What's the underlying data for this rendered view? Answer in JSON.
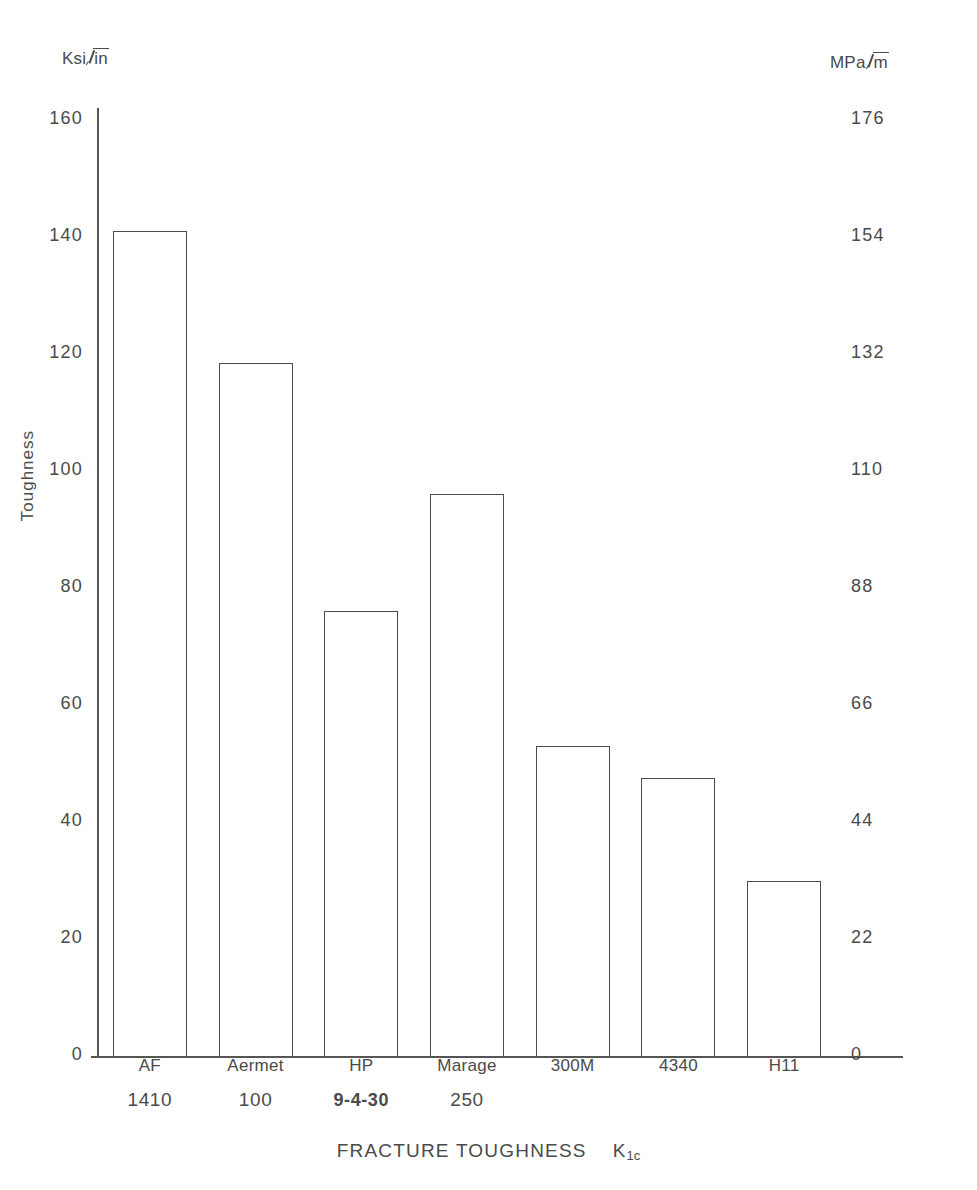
{
  "axes": {
    "left_unit_prefix": "Ksi",
    "left_unit_radicand": "in",
    "right_unit_prefix": "MPa",
    "right_unit_radicand": "m",
    "y_title": "Toughness",
    "x_title_main": "FRACTURE TOUGHNESS",
    "x_title_symbol": "K",
    "x_title_symbol_sub": "1c"
  },
  "chart_data": {
    "type": "bar",
    "xlabel": "FRACTURE TOUGHNESS  K1c",
    "ylabel": "Toughness",
    "y_unit_left": "Ksi√in",
    "y_unit_right": "MPa√m",
    "ylim": [
      0,
      160
    ],
    "ylim_right": [
      0,
      176
    ],
    "grid": false,
    "legend": "none",
    "categories": [
      "AF 1410",
      "Aermet 100",
      "HP 9-4-30",
      "Marage 250",
      "300M",
      "4340",
      "H11"
    ],
    "category_lines": [
      {
        "line1": "AF",
        "line2": "1410",
        "bold": false
      },
      {
        "line1": "Aermet",
        "line2": "100",
        "bold": false
      },
      {
        "line1": "HP",
        "line2": "9-4-30",
        "bold": true
      },
      {
        "line1": "Marage",
        "line2": "250",
        "bold": false
      },
      {
        "line1": "300M",
        "line2": "",
        "bold": false
      },
      {
        "line1": "4340",
        "line2": "",
        "bold": false
      },
      {
        "line1": "H11",
        "line2": "",
        "bold": false
      }
    ],
    "values": [
      141,
      118.5,
      76,
      96,
      53,
      47.5,
      30
    ],
    "values_mpa": [
      155,
      130,
      84,
      105,
      58,
      52,
      33
    ],
    "yticks_left": [
      160,
      140,
      120,
      100,
      80,
      60,
      40,
      20,
      0
    ],
    "yticks_right": [
      176,
      154,
      132,
      110,
      88,
      66,
      44,
      22,
      0
    ]
  }
}
